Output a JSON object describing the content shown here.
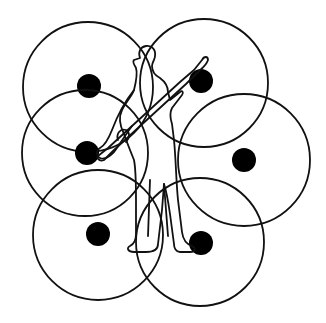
{
  "diagram": {
    "title": "",
    "colors": {
      "background": "#ffffff",
      "stroke": "#111111",
      "dot": "#000000"
    },
    "circles": [
      {
        "id": "top-left",
        "cx": 88,
        "cy": 87,
        "r": 65,
        "dot": {
          "cx": 89,
          "cy": 86,
          "r": 12
        }
      },
      {
        "id": "top-right",
        "cx": 204,
        "cy": 83,
        "r": 64,
        "dot": {
          "cx": 201,
          "cy": 81,
          "r": 12
        }
      },
      {
        "id": "middle-left",
        "cx": 85,
        "cy": 153,
        "r": 63,
        "dot": {
          "cx": 87,
          "cy": 153,
          "r": 12
        }
      },
      {
        "id": "middle-right",
        "cx": 244,
        "cy": 160,
        "r": 66,
        "dot": {
          "cx": 244,
          "cy": 160,
          "r": 12
        }
      },
      {
        "id": "bottom-left",
        "cx": 98,
        "cy": 235,
        "r": 65,
        "dot": {
          "cx": 98,
          "cy": 234,
          "r": 12
        }
      },
      {
        "id": "bottom-right",
        "cx": 200,
        "cy": 242,
        "r": 64,
        "dot": {
          "cx": 201,
          "cy": 243,
          "r": 12
        }
      }
    ],
    "figure": {
      "label": "person-with-rifle"
    }
  }
}
